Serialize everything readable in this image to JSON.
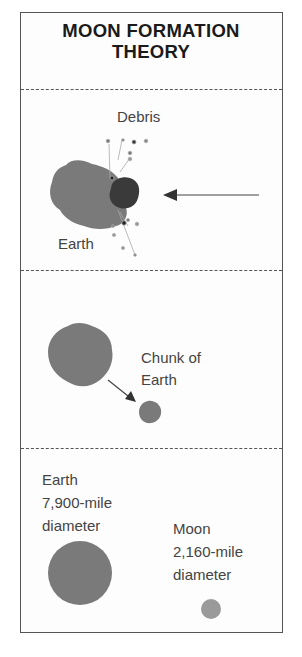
{
  "title": {
    "line1": "MOON FORMATION",
    "line2": "THEORY"
  },
  "panels": [
    {
      "id": "impact",
      "labels": {
        "debris": "Debris",
        "earth": "Earth"
      },
      "icons": [
        "earth-blob-icon",
        "impactor-blob-icon",
        "debris-particles-icon",
        "incoming-arrow-icon"
      ]
    },
    {
      "id": "chunk",
      "labels": {
        "chunk_line1": "Chunk of",
        "chunk_line2": "Earth"
      },
      "icons": [
        "earth-blob-icon",
        "chunk-arrow-icon",
        "chunk-blob-icon"
      ]
    },
    {
      "id": "comparison",
      "earth": {
        "line1": "Earth",
        "line2": "7,900-mile",
        "line3": "diameter"
      },
      "moon": {
        "line1": "Moon",
        "line2": "2,160-mile",
        "line3": "diameter"
      },
      "icons": [
        "earth-circle-icon",
        "moon-circle-icon"
      ]
    }
  ],
  "colors": {
    "earth": "#7a7a7a",
    "impactor": "#3a3a3a",
    "moon": "#9a9a9a",
    "border": "#555555",
    "text": "#444444"
  }
}
